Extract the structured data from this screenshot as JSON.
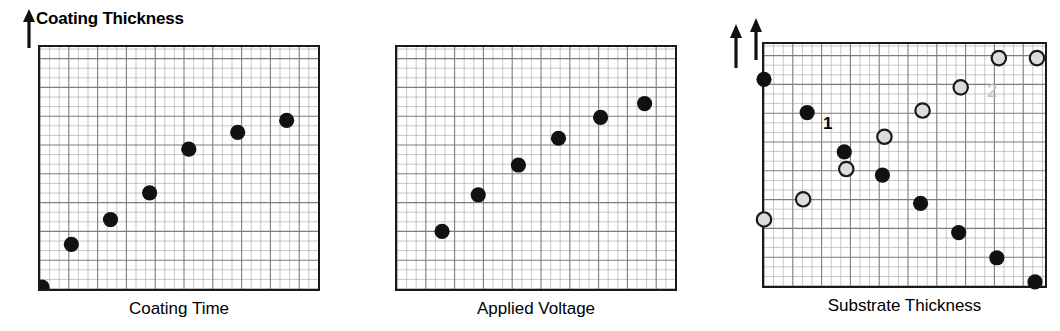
{
  "figure": {
    "background_color": "#ffffff",
    "ink_color": "#1a1a1a",
    "grid_color": "#8c8c8c",
    "grid_minor_color": "#b8b8b8",
    "series1_color": "#111111",
    "series2_fill_color": "#dcdcdc",
    "series2_stroke_color": "#1a1a1a",
    "series2_label_color": "#bdbdbd"
  },
  "panels": [
    {
      "id": "panel-coating-time",
      "y_axis_label": "Coating Thickness",
      "x_axis_label": "Coating Time",
      "arrow_label": "up-arrow"
    },
    {
      "id": "panel-applied-voltage",
      "y_axis_label": "",
      "x_axis_label": "Applied Voltage",
      "arrow_label": "up-arrow"
    },
    {
      "id": "panel-substrate-thickness",
      "y_axis_label": "",
      "x_axis_label": "Substrate Thickness",
      "arrow_label": "up-arrow",
      "series_markers": [
        {
          "name": "1",
          "text": "1",
          "style": "filled"
        },
        {
          "name": "2",
          "text": "2",
          "style": "open"
        }
      ]
    }
  ],
  "chart_data": [
    {
      "type": "scatter",
      "title": "",
      "xlabel": "Coating Time",
      "ylabel": "Coating Thickness",
      "xlim": [
        0,
        28
      ],
      "ylim": [
        0,
        24
      ],
      "grid": true,
      "legend": "none",
      "series": [
        {
          "name": "Coating thickness vs coating time",
          "marker": "filled-circle",
          "color": "#111111",
          "x": [
            0,
            3,
            7,
            11,
            15,
            20,
            25
          ],
          "y": [
            0,
            4.3,
            6.8,
            9.5,
            13.9,
            15.6,
            16.8
          ]
        }
      ]
    },
    {
      "type": "scatter",
      "title": "",
      "xlabel": "Applied Voltage",
      "ylabel": "Coating Thickness",
      "xlim": [
        0,
        28
      ],
      "ylim": [
        0,
        24
      ],
      "grid": true,
      "legend": "none",
      "series": [
        {
          "name": "Coating thickness vs applied voltage",
          "marker": "filled-circle",
          "color": "#111111",
          "x": [
            4.4,
            8.1,
            12.2,
            16.3,
            20.6,
            25.1
          ],
          "y": [
            5.6,
            9.3,
            12.3,
            15.0,
            17.1,
            18.5
          ]
        }
      ]
    },
    {
      "type": "scatter",
      "title": "",
      "xlabel": "Substrate Thickness",
      "ylabel": "Coating Thickness",
      "xlim": [
        0,
        28
      ],
      "ylim": [
        0,
        24
      ],
      "grid": true,
      "legend": "inline-markers",
      "series": [
        {
          "name": "1",
          "marker": "filled-circle",
          "color": "#111111",
          "x": [
            0.0,
            4.3,
            8.0,
            11.8,
            15.6,
            19.4,
            23.2,
            27.0
          ],
          "y": [
            20.5,
            17.2,
            13.3,
            11.0,
            8.2,
            5.3,
            2.8,
            0.4
          ]
        },
        {
          "name": "2",
          "marker": "open-circle",
          "fill": "#dcdcdc",
          "stroke": "#1a1a1a",
          "x": [
            0.0,
            3.9,
            8.2,
            12.0,
            15.8,
            19.6,
            23.4,
            27.2
          ],
          "y": [
            6.6,
            8.6,
            11.6,
            14.8,
            17.4,
            19.7,
            22.6,
            22.6
          ]
        }
      ]
    }
  ]
}
